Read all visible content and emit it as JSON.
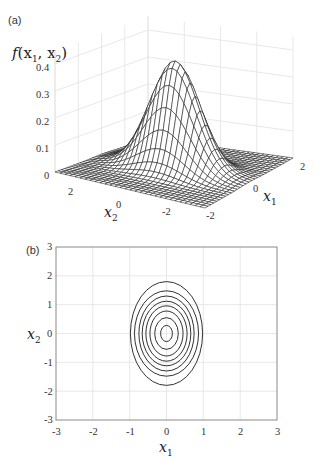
{
  "chart_data": [
    {
      "panel": "(a)",
      "type": "surface",
      "title": "",
      "function": "bivariate Gaussian density f(x1,x2), mean (0,0), sigma_x1 ~ 0.5, sigma_x2 ~ 0.8",
      "zlabel": "f(x₁, x₂)",
      "xlabel": "x₁",
      "ylabel": "x₂",
      "zticks": [
        "0",
        "0.1",
        "0.2",
        "0.3",
        "0.4"
      ],
      "x1_ticks": [
        "-2",
        "0",
        "2"
      ],
      "x2_ticks": [
        "2",
        "0",
        "-2"
      ],
      "zlim": [
        0,
        0.4
      ],
      "x1_range": [
        -2.5,
        2.5
      ],
      "x2_range": [
        -2.5,
        2.5
      ],
      "peak": {
        "x1": 0,
        "x2": 0,
        "f": 0.4
      },
      "grid": true,
      "style": "black wireframe mesh"
    },
    {
      "panel": "(b)",
      "type": "contour",
      "title": "",
      "xlabel": "x₁",
      "ylabel": "x₂",
      "xticks": [
        "-3",
        "-2",
        "-1",
        "0",
        "1",
        "2",
        "3"
      ],
      "yticks": [
        "3",
        "2",
        "1",
        "0",
        "-1",
        "-2",
        "-3"
      ],
      "xlim": [
        -3,
        3
      ],
      "ylim": [
        -3,
        3
      ],
      "grid": true,
      "center": [
        0,
        0
      ],
      "levels": 8,
      "contour_semi_axes": [
        {
          "a": 0.16,
          "b": 0.28
        },
        {
          "a": 0.32,
          "b": 0.55
        },
        {
          "a": 0.45,
          "b": 0.78
        },
        {
          "a": 0.56,
          "b": 0.96
        },
        {
          "a": 0.66,
          "b": 1.12
        },
        {
          "a": 0.75,
          "b": 1.3
        },
        {
          "a": 0.87,
          "b": 1.48
        },
        {
          "a": 0.98,
          "b": 1.8
        }
      ]
    }
  ],
  "labels": {
    "panel_a": "(a)",
    "panel_b": "(b)",
    "a_zlabel_f": "f",
    "a_zlabel_args": "(x",
    "a_zlabel_mid": ", x",
    "a_zlabel_end": ")",
    "sub1": "1",
    "sub2": "2",
    "x": "x"
  },
  "ticks": {
    "a_z": [
      "0.4",
      "0.3",
      "0.2",
      "0.1",
      "0"
    ],
    "a_x2": [
      "2",
      "0",
      "-2"
    ],
    "a_x1": [
      "-2",
      "0",
      "2"
    ],
    "b_y": [
      "3",
      "2",
      "1",
      "0",
      "-1",
      "-2",
      "-3"
    ],
    "b_x": [
      "-3",
      "-2",
      "-1",
      "0",
      "1",
      "2",
      "3"
    ]
  },
  "colors": {
    "line": "#1a1a1a",
    "grid": "#e2e2e2",
    "box": "#8a8a8a"
  }
}
